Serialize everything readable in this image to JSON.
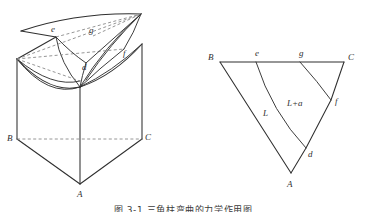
{
  "figure": {
    "caption": "图 3-1  三角柱弯曲的力学作用图",
    "line_color": "#2f2f2f",
    "dashed_color": "#7b7b7b",
    "background": "#ffffff"
  },
  "left_diagram": {
    "name": "three-dimensional-prism",
    "description": "triangular prism with warped upper surface",
    "vertex_labels": {
      "A": "A",
      "B": "B",
      "C": "C",
      "d": "d",
      "e": "e",
      "f": "f",
      "g": "g"
    }
  },
  "right_diagram": {
    "name": "planar-triangle-schematic",
    "description": "flat triangle ABC with interior fold lines",
    "vertex_labels": {
      "A": "A",
      "B": "B",
      "C": "C",
      "d": "d",
      "e": "e",
      "f": "f",
      "g": "g"
    },
    "annotations": {
      "L": "L",
      "L_plus_a": "L+a"
    }
  }
}
